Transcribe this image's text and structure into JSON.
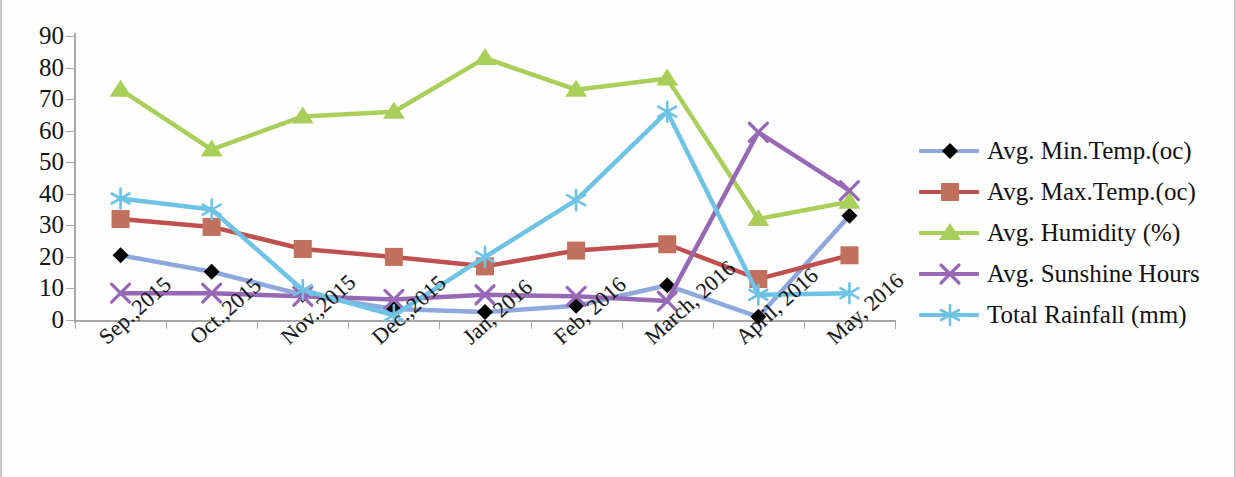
{
  "chart_data": {
    "type": "line",
    "title": "",
    "xlabel": "",
    "ylabel": "",
    "ylim": [
      0,
      90
    ],
    "ytick_step": 10,
    "yticks": [
      0,
      10,
      20,
      30,
      40,
      50,
      60,
      70,
      80,
      90
    ],
    "grid": false,
    "legend_position": "right",
    "categories": [
      "Sep.,2015",
      "Oct.,2015",
      "Nov.,2015",
      "Dec.,2015",
      "Jan, 2016",
      "Feb, 2016",
      "March, 2016",
      "April, 2016",
      "May, 2016"
    ],
    "series": [
      {
        "name": "Avg. Min.Temp.(oc)",
        "color": "#8FA8DC",
        "marker": "diamond",
        "marker_color": "#000000",
        "values": [
          20.5,
          15.3,
          8.0,
          3.5,
          2.5,
          4.5,
          11.0,
          1.0,
          33.0
        ]
      },
      {
        "name": "Avg. Max.Temp.(oc)",
        "color": "#C0504D",
        "marker": "square",
        "marker_color": "#C0705C",
        "values": [
          32.0,
          29.5,
          22.5,
          20.0,
          17.0,
          22.0,
          24.0,
          13.0,
          20.5
        ]
      },
      {
        "name": "Avg. Humidity (%)",
        "color": "#A9CF5A",
        "marker": "triangle",
        "marker_color": "#A9CF5A",
        "values": [
          73.0,
          54.0,
          64.5,
          66.0,
          83.0,
          73.0,
          76.5,
          32.0,
          37.5
        ]
      },
      {
        "name": "Avg. Sunshine Hours",
        "color": "#9768B4",
        "marker": "cross-x",
        "marker_color": "#9768B4",
        "values": [
          8.5,
          8.5,
          7.5,
          6.5,
          8.0,
          7.5,
          6.0,
          59.5,
          41.0
        ]
      },
      {
        "name": "Total Rainfall (mm)",
        "color": "#6EC2E4",
        "marker": "asterisk",
        "marker_color": "#6EC2E4",
        "values": [
          38.5,
          35.0,
          9.5,
          1.5,
          20.0,
          38.0,
          66.0,
          8.0,
          8.5
        ]
      }
    ]
  },
  "axis": {
    "y_tick_labels": [
      "90",
      "80",
      "70",
      "60",
      "50",
      "40",
      "30",
      "20",
      "10",
      "0"
    ]
  }
}
